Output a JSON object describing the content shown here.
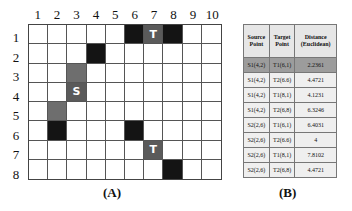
{
  "panel_a": {
    "caption": "(A)",
    "columns": [
      "1",
      "2",
      "3",
      "4",
      "5",
      "6",
      "7",
      "8",
      "9",
      "10"
    ],
    "rows": [
      "1",
      "2",
      "3",
      "4",
      "5",
      "6",
      "7",
      "8"
    ],
    "cells": [
      {
        "col": 6,
        "row": 1,
        "type": "obstacle",
        "label": ""
      },
      {
        "col": 7,
        "row": 1,
        "type": "target",
        "label": "T"
      },
      {
        "col": 8,
        "row": 1,
        "type": "obstacle",
        "label": ""
      },
      {
        "col": 4,
        "row": 2,
        "type": "obstacle",
        "label": ""
      },
      {
        "col": 3,
        "row": 3,
        "type": "path",
        "label": ""
      },
      {
        "col": 3,
        "row": 4,
        "type": "source",
        "label": "S"
      },
      {
        "col": 2,
        "row": 5,
        "type": "path",
        "label": ""
      },
      {
        "col": 2,
        "row": 6,
        "type": "obstacle",
        "label": ""
      },
      {
        "col": 6,
        "row": 6,
        "type": "obstacle",
        "label": ""
      },
      {
        "col": 7,
        "row": 7,
        "type": "target",
        "label": "T"
      },
      {
        "col": 8,
        "row": 8,
        "type": "obstacle",
        "label": ""
      }
    ]
  },
  "panel_b": {
    "caption": "(B)",
    "headers": [
      "Source Point",
      "Target Point",
      "Distance (Euclidean)"
    ],
    "rows": [
      {
        "source": "S1(4,2)",
        "target": "T1(6,1)",
        "distance": "2.2361",
        "highlight": true
      },
      {
        "source": "S1(4,2)",
        "target": "T2(6.6)",
        "distance": "4.4721",
        "highlight": false
      },
      {
        "source": "S1(4,2)",
        "target": "T1(8,1)",
        "distance": "4.1231",
        "highlight": false
      },
      {
        "source": "S1(4,2)",
        "target": "T2(6,8)",
        "distance": "6.3246",
        "highlight": false
      },
      {
        "source": "S2(2,6)",
        "target": "T1(6,1)",
        "distance": "6.4031",
        "highlight": false
      },
      {
        "source": "S2(2,6)",
        "target": "T2(6.6)",
        "distance": "4",
        "highlight": false
      },
      {
        "source": "S2(2,6)",
        "target": "T1(8,1)",
        "distance": "7.8102",
        "highlight": false
      },
      {
        "source": "S2(2,6)",
        "target": "T2(6,8)",
        "distance": "4.4721",
        "highlight": false
      }
    ]
  }
}
